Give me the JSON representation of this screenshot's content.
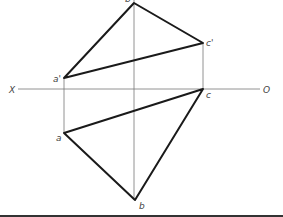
{
  "diagram": {
    "type": "orthographic-projection",
    "axis": {
      "left_label": "X",
      "right_label": "O"
    },
    "points": {
      "a_prime": {
        "label": "a'"
      },
      "b_prime": {
        "label": "b'"
      },
      "c_prime": {
        "label": "c'"
      },
      "a": {
        "label": "a"
      },
      "b": {
        "label": "b"
      },
      "c": {
        "label": "c"
      }
    },
    "colors": {
      "line": "#1a1a1a",
      "projection": "#777777"
    }
  }
}
